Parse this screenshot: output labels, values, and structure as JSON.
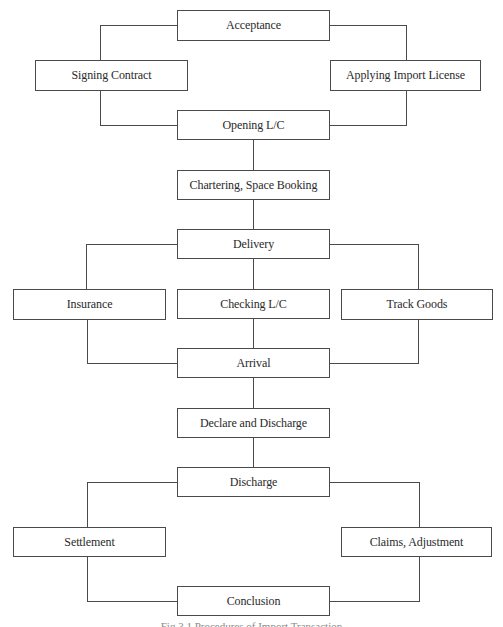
{
  "diagram": {
    "type": "flowchart",
    "title_caption": "Fig 3.1 Procedures of Import Transaction",
    "colors": {
      "line": "#4a4a4a",
      "box_fill": "#ffffff",
      "text": "#2a2a2a"
    },
    "nodes": {
      "acceptance": "Acceptance",
      "signing_contract": "Signing Contract",
      "applying_import_license": "Applying Import License",
      "opening_lc": "Opening L/C",
      "chartering": "Chartering, Space Booking",
      "delivery": "Delivery",
      "insurance": "Insurance",
      "checking_lc": "Checking L/C",
      "track_goods": "Track Goods",
      "arrival": "Arrival",
      "declare_discharge": "Declare and Discharge",
      "discharge": "Discharge",
      "settlement": "Settlement",
      "claims_adjustment": "Claims, Adjustment",
      "conclusion": "Conclusion"
    },
    "edges": [
      [
        "Acceptance",
        "Signing Contract"
      ],
      [
        "Acceptance",
        "Applying Import License"
      ],
      [
        "Signing Contract",
        "Opening L/C"
      ],
      [
        "Applying Import License",
        "Opening L/C"
      ],
      [
        "Opening L/C",
        "Chartering, Space Booking"
      ],
      [
        "Chartering, Space Booking",
        "Delivery"
      ],
      [
        "Delivery",
        "Insurance"
      ],
      [
        "Delivery",
        "Checking L/C"
      ],
      [
        "Delivery",
        "Track Goods"
      ],
      [
        "Insurance",
        "Arrival"
      ],
      [
        "Checking L/C",
        "Arrival"
      ],
      [
        "Track Goods",
        "Arrival"
      ],
      [
        "Arrival",
        "Declare and Discharge"
      ],
      [
        "Declare and Discharge",
        "Discharge"
      ],
      [
        "Discharge",
        "Settlement"
      ],
      [
        "Discharge",
        "Claims, Adjustment"
      ],
      [
        "Settlement",
        "Conclusion"
      ],
      [
        "Claims, Adjustment",
        "Conclusion"
      ]
    ]
  }
}
